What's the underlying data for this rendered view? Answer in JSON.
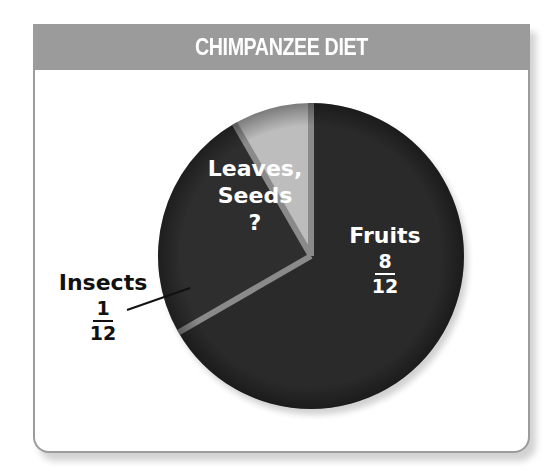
{
  "chart_data": {
    "type": "pie",
    "title": "CHIMPANZEE DIET",
    "categories": [
      "Fruits",
      "Leaves, Seeds",
      "Insects"
    ],
    "values": [
      8,
      3,
      1
    ],
    "value_labels": [
      "8/12",
      "?",
      "1/12"
    ],
    "denominator": 12,
    "colors": [
      "#2a2a2a",
      "#2e2e2e",
      "#bdbdbd"
    ],
    "start_angle_deg": 0,
    "legend": "none",
    "grid": false
  },
  "header": {
    "title": "CHIMPANZEE DIET"
  },
  "labels": {
    "fruits": {
      "name": "Fruits",
      "numerator": "8",
      "denominator": "12"
    },
    "leaves": {
      "line1": "Leaves,",
      "line2": "Seeds",
      "value": "?"
    },
    "insects": {
      "name": "Insects",
      "numerator": "1",
      "denominator": "12"
    }
  },
  "colors": {
    "header_bg": "#9b9b9b",
    "card_border": "#9c9c9c",
    "fruits": "#2a2a2a",
    "leaves": "#2e2e2e",
    "insects": "#bdbdbd",
    "separator": "#8a8a8a"
  }
}
